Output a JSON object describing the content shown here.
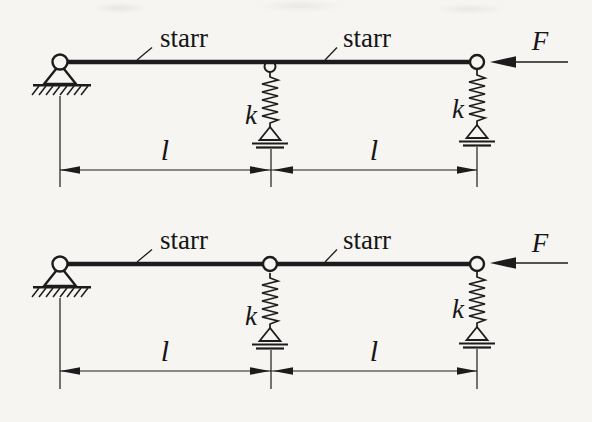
{
  "figure": {
    "kind": "statics-diagram",
    "colors": {
      "ink": "#1c1c1c",
      "paper": "#f6f5f2"
    },
    "diagrams": [
      {
        "name": "continuous rigid beam on pin support and two springs",
        "segment_label_left": "starr",
        "segment_label_right": "starr",
        "force_label": "F",
        "spring_mid_label": "k",
        "spring_right_label": "k",
        "span_left_label": "l",
        "span_right_label": "l"
      },
      {
        "name": "two rigid beams hinged at midspan on pin support and two springs",
        "segment_label_left": "starr",
        "segment_label_right": "starr",
        "force_label": "F",
        "spring_mid_label": "k",
        "spring_right_label": "k",
        "span_left_label": "l",
        "span_right_label": "l"
      }
    ]
  }
}
